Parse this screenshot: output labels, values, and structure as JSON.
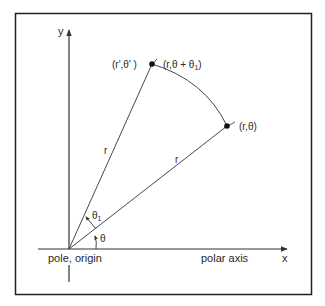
{
  "diagram": {
    "axes": {
      "y_label": "y",
      "x_label": "x",
      "polar_axis_label": "polar axis",
      "origin_label": "pole, origin"
    },
    "points": {
      "rotated": {
        "label_left": "(r',θ' )",
        "label_right": "(r,θ + θ",
        "label_right_sub": "1",
        "label_right_close": ")"
      },
      "original": {
        "label": "(r,θ)"
      }
    },
    "segments": {
      "r_rotated": "r",
      "r_original": "r"
    },
    "angles": {
      "theta": "θ",
      "theta1": "θ",
      "theta1_sub": "1"
    },
    "colors": {
      "line": "#333333",
      "frame": "#222222",
      "background": "#ffffff"
    }
  }
}
